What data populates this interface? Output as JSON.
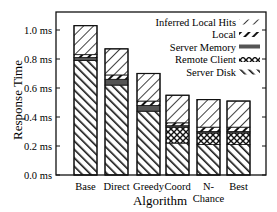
{
  "chart_data": {
    "type": "bar",
    "stacked": true,
    "title": "",
    "xlabel": "Algorithm",
    "ylabel": "Response Time",
    "ylim": [
      0,
      1.12
    ],
    "yticks": [
      0.0,
      0.2,
      0.4,
      0.6,
      0.8,
      1.0
    ],
    "ytick_labels": [
      "0.0 ms",
      "0.2 ms",
      "0.4 ms",
      "0.6 ms",
      "0.8 ms",
      "1.0 ms"
    ],
    "grid": false,
    "legend_position": "upper right (inside)",
    "categories": [
      "Base",
      "Direct",
      "Greedy",
      "Coord",
      "N-Chance",
      "Best"
    ],
    "category_labels": [
      [
        "Base"
      ],
      [
        "Direct"
      ],
      [
        "Greedy"
      ],
      [
        "Coord"
      ],
      [
        "N-",
        "Chance"
      ],
      [
        "Best"
      ]
    ],
    "series": [
      {
        "name": "Server Disk",
        "pattern": "diag-thick-forward",
        "values": [
          0.79,
          0.62,
          0.44,
          0.22,
          0.21,
          0.21
        ]
      },
      {
        "name": "Remote Client",
        "pattern": "crosshatch",
        "values": [
          0.0,
          0.0,
          0.0,
          0.11,
          0.08,
          0.08
        ]
      },
      {
        "name": "Server Memory",
        "pattern": "solid-dark",
        "values": [
          0.02,
          0.04,
          0.04,
          0.01,
          0.01,
          0.01
        ]
      },
      {
        "name": "Local",
        "pattern": "diag-thick-back",
        "values": [
          0.02,
          0.03,
          0.03,
          0.02,
          0.03,
          0.03
        ]
      },
      {
        "name": "Inferred Local Hits",
        "pattern": "diag-thin-back",
        "values": [
          0.2,
          0.18,
          0.19,
          0.19,
          0.19,
          0.18
        ]
      }
    ],
    "totals": [
      1.03,
      0.87,
      0.7,
      0.55,
      0.52,
      0.51
    ]
  },
  "legend": {
    "items": [
      {
        "label": "Inferred Local Hits",
        "pattern": "diag-thin-back"
      },
      {
        "label": "Local",
        "pattern": "diag-thick-back"
      },
      {
        "label": "Server Memory",
        "pattern": "solid-dark"
      },
      {
        "label": "Remote Client",
        "pattern": "crosshatch"
      },
      {
        "label": "Server Disk",
        "pattern": "diag-thick-forward"
      }
    ]
  },
  "colors": {
    "ink": "#111111",
    "background": "#ffffff",
    "server_memory": "#555555"
  }
}
